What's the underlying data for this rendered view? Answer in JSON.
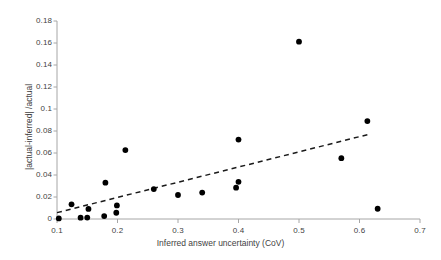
{
  "chart_data": {
    "type": "scatter",
    "title": "",
    "xlabel": "Inferred answer uncertainty (CoV)",
    "ylabel": "|actual-inferred| /actual",
    "xlim": [
      0.1,
      0.7
    ],
    "ylim": [
      0,
      0.18
    ],
    "xticks": [
      0.1,
      0.2,
      0.3,
      0.4,
      0.5,
      0.6,
      0.7
    ],
    "xtick_labels": [
      "0.1",
      "0.2",
      "0.3",
      "0.4",
      "0.5",
      "0.6",
      "0.7"
    ],
    "yticks": [
      0,
      0.02,
      0.04,
      0.06,
      0.08,
      0.1,
      0.12,
      0.14,
      0.16,
      0.18
    ],
    "ytick_labels": [
      "0",
      "0.02",
      "0.04",
      "0.06",
      "0.08",
      "0.1",
      "0.12",
      "0.14",
      "0.16",
      "0.18"
    ],
    "grid": false,
    "legend": "none",
    "marker_color": "#000000",
    "marker_size": 4.4,
    "points": [
      {
        "x": 0.103,
        "y": 0.0005
      },
      {
        "x": 0.124,
        "y": 0.0133
      },
      {
        "x": 0.139,
        "y": 0.0012
      },
      {
        "x": 0.15,
        "y": 0.0013
      },
      {
        "x": 0.152,
        "y": 0.0092
      },
      {
        "x": 0.178,
        "y": 0.0027
      },
      {
        "x": 0.18,
        "y": 0.033
      },
      {
        "x": 0.198,
        "y": 0.0057
      },
      {
        "x": 0.199,
        "y": 0.0123
      },
      {
        "x": 0.213,
        "y": 0.0627
      },
      {
        "x": 0.26,
        "y": 0.0272
      },
      {
        "x": 0.3,
        "y": 0.0218
      },
      {
        "x": 0.34,
        "y": 0.024
      },
      {
        "x": 0.396,
        "y": 0.0285
      },
      {
        "x": 0.4,
        "y": 0.0338
      },
      {
        "x": 0.4,
        "y": 0.0722
      },
      {
        "x": 0.5,
        "y": 0.1612
      },
      {
        "x": 0.57,
        "y": 0.0553
      },
      {
        "x": 0.613,
        "y": 0.089
      },
      {
        "x": 0.63,
        "y": 0.0093
      }
    ],
    "trendline": {
      "style": "dashed",
      "color": "#1a1a1a",
      "x_start": 0.1,
      "y_start": 0.0058,
      "x_end": 0.617,
      "y_end": 0.0772
    }
  },
  "axis": {
    "line_color": "#a6a6a6"
  }
}
